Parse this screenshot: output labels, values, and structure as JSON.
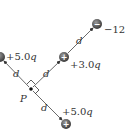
{
  "diagram": {
    "point_label": "P",
    "distance_label": "d",
    "charges": [
      {
        "id": "left",
        "label": "+5.0",
        "unit": "q",
        "sign": "+"
      },
      {
        "id": "middle",
        "label": "+3.0",
        "unit": "q",
        "sign": "+"
      },
      {
        "id": "top-right",
        "label": "−12",
        "unit": "q",
        "sign": "−"
      },
      {
        "id": "bottom",
        "label": "+5.0",
        "unit": "q",
        "sign": "+"
      }
    ]
  }
}
